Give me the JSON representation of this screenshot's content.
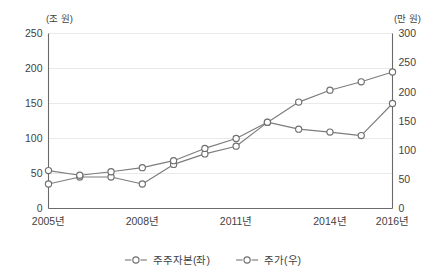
{
  "chart_data": {
    "type": "line",
    "title": "",
    "subtitle": "",
    "xlabel": "",
    "ylabel": "",
    "grid": true,
    "legend_position": "bottom-center",
    "x": [
      2005,
      2006,
      2007,
      2008,
      2009,
      2010,
      2011,
      2012,
      2013,
      2014,
      2015,
      2016
    ],
    "categories": [
      "2005",
      "2006",
      "2007",
      "2008",
      "2009",
      "2010",
      "2011",
      "2012",
      "2013",
      "2014",
      "2015",
      "2016"
    ],
    "x_tick_labels": [
      "2005년",
      "2008년",
      "2011년",
      "2014년",
      "2016년"
    ],
    "x_tick_values": [
      2005,
      2008,
      2011,
      2014,
      2016
    ],
    "left_axis": {
      "unit_label": "(조 원)",
      "ylim": [
        0,
        250
      ],
      "ticks": [
        0,
        50,
        100,
        150,
        200,
        250
      ],
      "tick_labels": [
        "0",
        "50",
        "100",
        "150",
        "200",
        "250"
      ]
    },
    "right_axis": {
      "unit_label": "(만 원)",
      "ylim": [
        0,
        300
      ],
      "ticks": [
        0,
        50,
        100,
        150,
        200,
        250,
        300
      ],
      "tick_labels": [
        "0",
        "50",
        "100",
        "150",
        "200",
        "250",
        "300"
      ]
    },
    "series": [
      {
        "name": "주주자본(좌)",
        "axis": "left",
        "unit": "조 원",
        "marker": "open-circle",
        "color": "#7d7d7d",
        "values": [
          35,
          45,
          45,
          35,
          63,
          78,
          89,
          123,
          152,
          169,
          181,
          195
        ]
      },
      {
        "name": "주가(우)",
        "axis": "right",
        "unit": "만 원",
        "marker": "open-circle",
        "color": "#7d7d7d",
        "values": [
          65,
          57,
          63,
          70,
          82,
          103,
          120,
          148,
          136,
          131,
          125,
          180
        ]
      }
    ]
  },
  "legend": {
    "items": [
      {
        "label": "주주자본(좌)"
      },
      {
        "label": "주가(우)"
      }
    ]
  },
  "colors": {
    "line": "#7d7d7d",
    "marker_fill": "#ffffff",
    "marker_stroke": "#6f6f6f",
    "frame": "#6a6a6a",
    "gridline": "#e9e9e9",
    "text": "#3f3f3f",
    "background": "#ffffff"
  }
}
